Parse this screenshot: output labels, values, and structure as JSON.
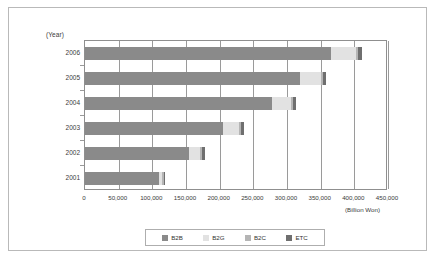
{
  "chart_data": {
    "type": "bar",
    "orientation": "horizontal",
    "stacked": true,
    "title": "",
    "xlabel": "(Billion Won)",
    "ylabel": "(Year)",
    "categories": [
      "2006",
      "2005",
      "2004",
      "2003",
      "2002",
      "2001"
    ],
    "xlim": [
      0,
      450000
    ],
    "xticks": [
      0,
      50000,
      100000,
      150000,
      200000,
      250000,
      300000,
      350000,
      400000,
      450000
    ],
    "xtick_labels": [
      "0",
      "50,000",
      "100,000",
      "150,000",
      "200,000",
      "250,000",
      "300,000",
      "350,000",
      "400,000",
      "450,000"
    ],
    "grid": true,
    "legend_position": "bottom",
    "series": [
      {
        "name": "B2B",
        "color": "#8a8a8a",
        "values": [
          365000,
          320000,
          278000,
          205000,
          155000,
          110000
        ]
      },
      {
        "name": "B2G",
        "color": "#e2e2e2",
        "values": [
          38000,
          30000,
          28000,
          24000,
          16000,
          5000
        ]
      },
      {
        "name": "B2C",
        "color": "#b5b5b5",
        "values": [
          3000,
          3000,
          3000,
          3000,
          3000,
          2000
        ]
      },
      {
        "name": "ETC",
        "color": "#6f6f6f",
        "values": [
          6000,
          5000,
          5000,
          4000,
          4000,
          2000
        ]
      }
    ],
    "totals": [
      412000,
      358000,
      314000,
      236000,
      178000,
      119000
    ]
  },
  "axis": {
    "year_caption": "(Year)",
    "unit_caption": "(Billion Won)"
  },
  "legend": {
    "items": [
      {
        "label": "B2B",
        "color": "#8a8a8a"
      },
      {
        "label": "B2G",
        "color": "#e2e2e2"
      },
      {
        "label": "B2C",
        "color": "#b5b5b5"
      },
      {
        "label": "ETC",
        "color": "#6f6f6f"
      }
    ]
  }
}
